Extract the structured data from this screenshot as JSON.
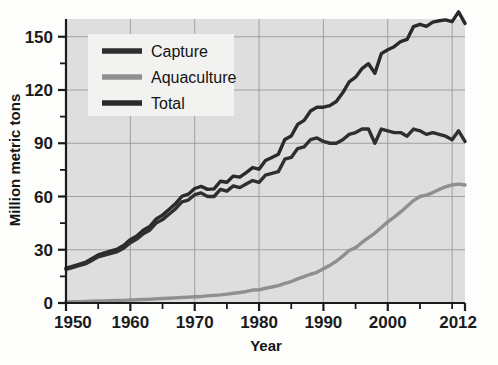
{
  "chart_data": {
    "type": "line",
    "title": "",
    "xlabel": "Year",
    "ylabel": "Million metric tons",
    "xlim": [
      1950,
      2012
    ],
    "ylim": [
      0,
      160
    ],
    "xticks": [
      1950,
      1955,
      1960,
      1965,
      1970,
      1975,
      1980,
      1985,
      1990,
      1995,
      2000,
      2005,
      2010,
      2012
    ],
    "xtick_labels": [
      "1950",
      "",
      "1960",
      "",
      "1970",
      "",
      "1980",
      "",
      "1990",
      "",
      "2000",
      "",
      "",
      "2012"
    ],
    "yticks": [
      0,
      15,
      30,
      45,
      60,
      75,
      90,
      105,
      120,
      135,
      150
    ],
    "ytick_labels": [
      "0",
      "",
      "30",
      "",
      "60",
      "",
      "90",
      "",
      "120",
      "",
      "150"
    ],
    "grid": "both-major",
    "legend_position": "top-left",
    "colors": {
      "capture": "#2f2f2f",
      "aquaculture": "#8f8f8f",
      "total": "#2a2a2a",
      "plot_background": "#dedede",
      "gridline": "#9a9a9a",
      "axis": "#1b1b1b",
      "legend_background": "#f2f2f0"
    },
    "x": [
      1950,
      1951,
      1952,
      1953,
      1954,
      1955,
      1956,
      1957,
      1958,
      1959,
      1960,
      1961,
      1962,
      1963,
      1964,
      1965,
      1966,
      1967,
      1968,
      1969,
      1970,
      1971,
      1972,
      1973,
      1974,
      1975,
      1976,
      1977,
      1978,
      1979,
      1980,
      1981,
      1982,
      1983,
      1984,
      1985,
      1986,
      1987,
      1988,
      1989,
      1990,
      1991,
      1992,
      1993,
      1994,
      1995,
      1996,
      1997,
      1998,
      1999,
      2000,
      2001,
      2002,
      2003,
      2004,
      2005,
      2006,
      2007,
      2008,
      2009,
      2010,
      2011,
      2012
    ],
    "series": [
      {
        "name": "Capture",
        "color": "#2f2f2f",
        "values": [
          19,
          20,
          21,
          22,
          24,
          26,
          27,
          28,
          29,
          31,
          34,
          36,
          39,
          41,
          45,
          47,
          50,
          53,
          57,
          58,
          61,
          62,
          60,
          60,
          64,
          63,
          66,
          65,
          67,
          69,
          68,
          72,
          73,
          74,
          81,
          82,
          87,
          88,
          92,
          93,
          91,
          90,
          90,
          92,
          95,
          96,
          98,
          98,
          90,
          98,
          97,
          96,
          96,
          94,
          98,
          97,
          95,
          96,
          95,
          94,
          92,
          97,
          91
        ]
      },
      {
        "name": "Aquaculture",
        "color": "#8f8f8f",
        "values": [
          0.6,
          0.7,
          0.8,
          0.9,
          1.0,
          1.1,
          1.2,
          1.3,
          1.4,
          1.5,
          1.7,
          1.8,
          2.0,
          2.1,
          2.3,
          2.5,
          2.7,
          2.9,
          3.1,
          3.3,
          3.5,
          3.7,
          4.0,
          4.3,
          4.6,
          5.0,
          5.5,
          5.9,
          6.5,
          7.3,
          7.4,
          8.3,
          9.0,
          9.8,
          11.1,
          12.1,
          13.6,
          14.9,
          16.2,
          17.3,
          19.3,
          21.2,
          23.5,
          26.4,
          29.6,
          31.2,
          34.1,
          36.8,
          39.4,
          42.5,
          45.7,
          48.4,
          51.3,
          54.5,
          57.7,
          60.0,
          60.8,
          62.2,
          64.0,
          65.5,
          66.5,
          67.0,
          66.5
        ]
      },
      {
        "name": "Total",
        "color": "#2a2a2a",
        "values": [
          19.6,
          20.7,
          21.8,
          22.9,
          25.0,
          27.1,
          28.2,
          29.3,
          30.4,
          32.5,
          35.7,
          37.8,
          41.0,
          43.1,
          47.3,
          49.5,
          52.7,
          55.9,
          60.1,
          61.3,
          64.5,
          65.7,
          64.0,
          64.3,
          68.6,
          68.0,
          71.5,
          70.9,
          73.5,
          76.3,
          75.4,
          80.3,
          82.0,
          83.8,
          92.1,
          94.1,
          100.6,
          102.9,
          108.2,
          110.3,
          110.3,
          111.2,
          113.5,
          118.4,
          124.6,
          127.2,
          132.1,
          134.8,
          129.4,
          140.5,
          142.7,
          144.4,
          147.3,
          148.5,
          155.7,
          157.0,
          155.8,
          158.2,
          159.0,
          159.5,
          158.5,
          164.0,
          157.5
        ]
      }
    ]
  },
  "legend": {
    "items": [
      {
        "label": "Capture",
        "color": "#2f2f2f"
      },
      {
        "label": "Aquaculture",
        "color": "#8f8f8f"
      },
      {
        "label": "Total",
        "color": "#2a2a2a"
      }
    ]
  },
  "axes": {
    "x_title": "Year",
    "y_title": "Million metric tons",
    "x_labels": [
      "1950",
      "1960",
      "1970",
      "1980",
      "1990",
      "2000",
      "2012"
    ],
    "y_labels": [
      "0",
      "30",
      "60",
      "90",
      "120",
      "150"
    ]
  },
  "bleed_through": {
    "left": "",
    "right": "",
    "mid": ""
  }
}
